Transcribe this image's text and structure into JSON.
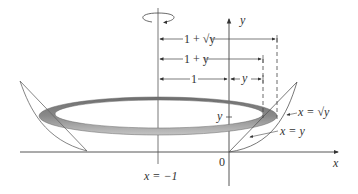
{
  "figure": {
    "rotation_axis_label": "x = −1",
    "y_axis_label": "y",
    "x_axis_label": "x",
    "origin_label": "0",
    "dimension_labels": {
      "outer_radius": "1 + √y",
      "inner_radius": "1 + y",
      "offset": "1",
      "segment": "y"
    },
    "height_marker_label": "y",
    "curve_labels": {
      "sqrt_curve": "x = √y",
      "line": "x = y"
    },
    "colors": {
      "line": "#555555",
      "ring_dark": "#7a7a7a",
      "ring_light": "#bdbdbd",
      "text": "#333333"
    }
  }
}
